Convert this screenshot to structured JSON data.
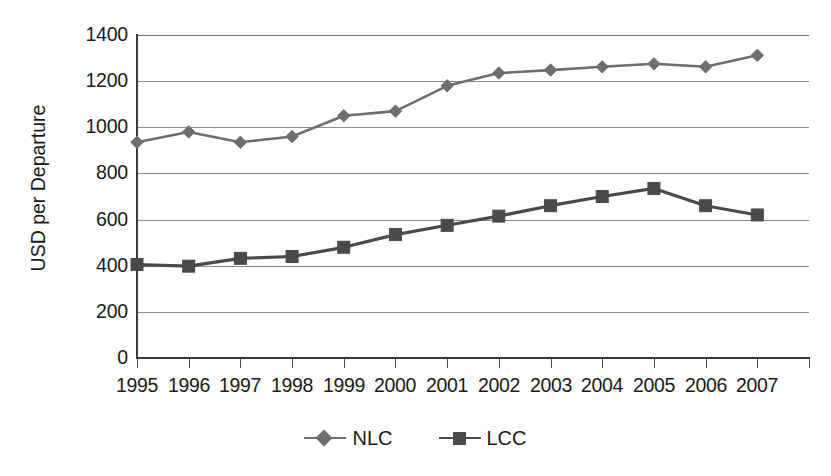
{
  "chart_data": {
    "type": "line",
    "title": "",
    "xlabel": "",
    "ylabel": "USD per Departure",
    "x": [
      1995,
      1996,
      1997,
      1998,
      1999,
      2000,
      2001,
      2002,
      2003,
      2004,
      2005,
      2006,
      2007
    ],
    "categories": [
      "1995",
      "1996",
      "1997",
      "1998",
      "1999",
      "2000",
      "2001",
      "2002",
      "2003",
      "2004",
      "2005",
      "2006",
      "2007"
    ],
    "series": [
      {
        "name": "NLC",
        "marker": "diamond",
        "color": "#6e6e6e",
        "values": [
          935,
          980,
          935,
          960,
          1050,
          1070,
          1180,
          1235,
          1248,
          1262,
          1275,
          1262,
          1312
        ]
      },
      {
        "name": "LCC",
        "marker": "square",
        "color": "#4a4a4a",
        "values": [
          405,
          398,
          432,
          440,
          480,
          535,
          575,
          615,
          660,
          700,
          735,
          660,
          620
        ]
      }
    ],
    "ylim": [
      0,
      1400
    ],
    "yticks": [
      0,
      200,
      400,
      600,
      800,
      1000,
      1200,
      1400
    ],
    "ytick_labels": [
      "0",
      "200",
      "400",
      "600",
      "800",
      "1000",
      "1200",
      "1400"
    ],
    "grid": true,
    "grid_axis": "y",
    "legend_position": "bottom",
    "legend": [
      "NLC",
      "LCC"
    ]
  },
  "axes": {
    "y_title": "USD per Departure",
    "y_tick_labels": [
      "1400",
      "1200",
      "1000",
      "800",
      "600",
      "400",
      "200",
      "0"
    ],
    "x_tick_labels": [
      "1995",
      "1996",
      "1997",
      "1998",
      "1999",
      "2000",
      "2001",
      "2002",
      "2003",
      "2004",
      "2005",
      "2006",
      "2007"
    ]
  },
  "legend": {
    "items": [
      {
        "label": "NLC",
        "marker": "diamond-marker-icon",
        "color": "#6e6e6e"
      },
      {
        "label": "LCC",
        "marker": "square-marker-icon",
        "color": "#4a4a4a"
      }
    ]
  },
  "colors": {
    "nlc_line": "#6e6e6e",
    "lcc_line": "#4a4a4a",
    "gridline": "#8d8d8d",
    "axis": "#3a3a3a",
    "text": "#1a1a1a",
    "background": "#ffffff"
  }
}
